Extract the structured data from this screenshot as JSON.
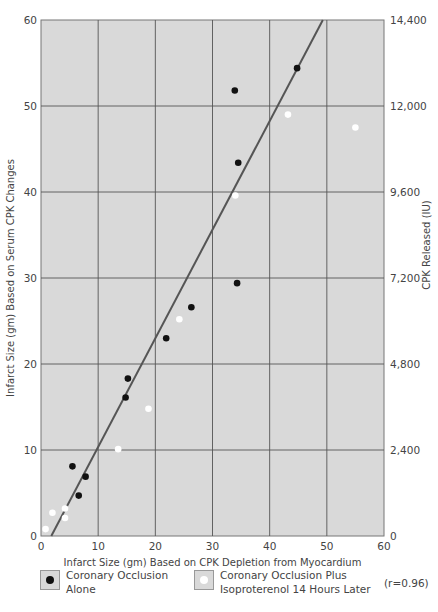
{
  "chart_data": {
    "type": "scatter",
    "title": "",
    "xlabel": "Infarct Size (gm) Based on CPK Depletion from Myocardium",
    "ylabel": "Infarct Size (gm) Based on Serum CPK Changes",
    "y2label": "CPK Released (IU)",
    "xlim": [
      0,
      60
    ],
    "ylim": [
      0,
      60
    ],
    "y2lim": [
      0,
      14400
    ],
    "x_ticks": [
      "0",
      "10",
      "20",
      "30",
      "40",
      "50",
      "60"
    ],
    "y_ticks": [
      "0",
      "10",
      "20",
      "30",
      "40",
      "50",
      "60"
    ],
    "y2_ticks": [
      "0",
      "2,400",
      "4,800",
      "7,200",
      "9,600",
      "12,000",
      "14,400"
    ],
    "grid": true,
    "legend_position": "bottom",
    "series": [
      {
        "name": "Coronary Occlusion Alone",
        "marker_color": "#111111",
        "points": [
          [
            5.5,
            8.1
          ],
          [
            7.8,
            6.9
          ],
          [
            6.6,
            4.7
          ],
          [
            14.8,
            16.1
          ],
          [
            15.2,
            18.3
          ],
          [
            21.9,
            23.0
          ],
          [
            26.3,
            26.6
          ],
          [
            33.9,
            51.8
          ],
          [
            34.5,
            43.4
          ],
          [
            34.3,
            29.4
          ],
          [
            44.8,
            54.4
          ]
        ]
      },
      {
        "name": "Coronary Occlusion Plus Isoproterenol 14 Hours Later",
        "marker_color": "#ffffff",
        "points": [
          [
            0.8,
            0.8
          ],
          [
            2.0,
            2.7
          ],
          [
            4.2,
            3.2
          ],
          [
            4.2,
            2.1
          ],
          [
            13.5,
            10.1
          ],
          [
            18.8,
            14.8
          ],
          [
            24.2,
            25.2
          ],
          [
            34.0,
            39.6
          ],
          [
            43.2,
            49.0
          ],
          [
            55.0,
            47.5
          ]
        ]
      }
    ],
    "regression_line": {
      "x1": 1.8,
      "y1": 0,
      "x2": 49.3,
      "y2": 60,
      "color": "#555555"
    },
    "annotation": "(r=0.96)"
  },
  "legend": {
    "item1": "Coronary Occlusion\nAlone",
    "item2": "Coronary Occlusion Plus\nIsoproterenol 14 Hours Later",
    "r_value": "(r=0.96)"
  },
  "colors": {
    "plot_bg": "#d9d9d9",
    "grid": "#555555",
    "line": "#555555"
  }
}
